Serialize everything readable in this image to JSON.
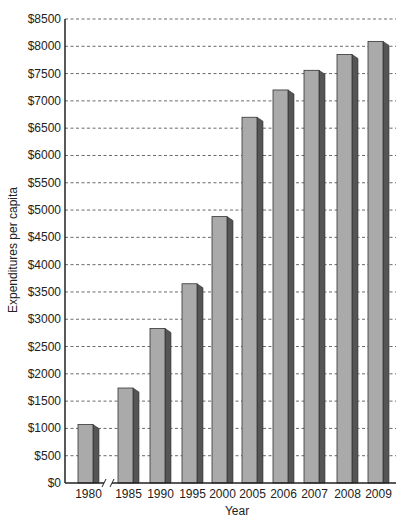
{
  "chart_data": {
    "type": "bar",
    "title": "",
    "xlabel": "Year",
    "ylabel": "Expenditures per capita",
    "categories": [
      "1980",
      "1985",
      "1990",
      "1995",
      "2000",
      "2005",
      "2006",
      "2007",
      "2008",
      "2009"
    ],
    "values": [
      1070,
      1740,
      2830,
      3650,
      4880,
      6700,
      7200,
      7560,
      7850,
      8090
    ],
    "ylim": [
      0,
      8500
    ],
    "yticks": [
      0,
      500,
      1000,
      1500,
      2000,
      2500,
      3000,
      3500,
      4000,
      4500,
      5000,
      5500,
      6000,
      6500,
      7000,
      7500,
      8000,
      8500
    ],
    "ytick_labels": [
      "$0",
      "$500",
      "$1000",
      "$1500",
      "$2000",
      "$2500",
      "$3000",
      "$3500",
      "$4000",
      "$4500",
      "$5000",
      "$5500",
      "$6000",
      "$6500",
      "$7000",
      "$7500",
      "$8000",
      "$8500"
    ],
    "grid": "horizontal-dashed",
    "legend": "none",
    "axis_break": "between 1980 and 1985",
    "colors": {
      "bar_front": "#aaaaaa",
      "bar_side": "#555555",
      "bar_top": "#cfcfcf",
      "grid": "#444444",
      "axis": "#222222"
    }
  }
}
